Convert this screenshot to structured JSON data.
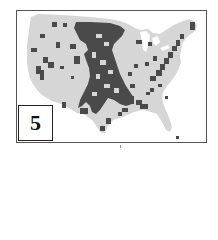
{
  "figure": {
    "panel_label": "5",
    "map_region": "Contiguous United States (county-level)",
    "colors": {
      "highlighted_counties": "#4a4a4a",
      "other_counties": "#d6d6d6",
      "background": "#ffffff",
      "frame": "#555555"
    }
  }
}
